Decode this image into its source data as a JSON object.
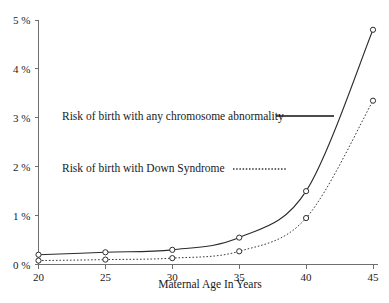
{
  "chart_data": {
    "type": "line",
    "title": "",
    "xlabel": "Maternal Age In Years",
    "ylabel": "",
    "x": [
      20,
      25,
      30,
      35,
      40,
      45
    ],
    "xlim": [
      20,
      45
    ],
    "ylim": [
      0,
      5
    ],
    "grid": false,
    "legend_position": "upper-left-inside",
    "xtick_labels": [
      "20",
      "25",
      "30",
      "35",
      "40",
      "45"
    ],
    "ytick_labels": [
      "0 %",
      "1 %",
      "2 %",
      "3 %",
      "4 %",
      "5 %"
    ],
    "ytick_values": [
      0,
      1,
      2,
      3,
      4,
      5
    ],
    "series": [
      {
        "name": "Risk of birth with any chromosome abnormality",
        "style": "solid",
        "marker": "open-circle",
        "values": [
          0.2,
          0.25,
          0.3,
          0.55,
          1.5,
          4.8
        ]
      },
      {
        "name": "Risk of birth with Down Syndrome",
        "style": "dotted",
        "marker": "open-circle",
        "values": [
          0.08,
          0.1,
          0.13,
          0.27,
          0.95,
          3.35
        ]
      }
    ]
  },
  "legend": {
    "entries": [
      {
        "label": "Risk of birth with any chromosome abnormality",
        "style": "solid"
      },
      {
        "label": "Risk of birth with Down Syndrome",
        "style": "dotted"
      }
    ]
  },
  "colors": {
    "series_solid": "#2b2b2b",
    "series_dotted": "#3a3a3a",
    "axis": "#6e6e6e",
    "text": "#1a1a1a",
    "background": "#ffffff"
  }
}
